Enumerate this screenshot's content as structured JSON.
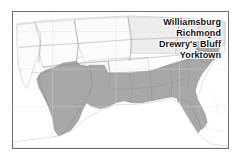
{
  "figure": {
    "name": "united-states-map-confederate-states-virginia-sites",
    "frame_color": "#6e6e6e",
    "background_color": "#ffffff"
  },
  "map": {
    "shaded_region_color": "#a8a8a8",
    "unshaded_region_color": "#fbfbfb",
    "state_border_color": "#8d8d8d",
    "coastline_color": "#9a9a9a",
    "shaded_region_name": "Confederate States",
    "unshaded_region_name": "Union and Western Territories"
  },
  "labels": [
    {
      "id": "williamsburg",
      "text": "Williamsburg",
      "name": "map-label-williamsburg"
    },
    {
      "id": "richmond",
      "text": "Richmond",
      "name": "map-label-richmond"
    },
    {
      "id": "drewrys",
      "text": "Drewry's Bluff",
      "name": "map-label-drewrys-bluff"
    },
    {
      "id": "yorktown",
      "text": "Yorktown",
      "name": "map-label-yorktown"
    }
  ],
  "markers": {
    "color": "#0d0d0d",
    "points": [
      {
        "id": "marker-1",
        "x": 209,
        "y": 36
      },
      {
        "id": "marker-2",
        "x": 215,
        "y": 35
      },
      {
        "id": "marker-3",
        "x": 213,
        "y": 42
      },
      {
        "id": "marker-4",
        "x": 219,
        "y": 40
      },
      {
        "id": "marker-5",
        "x": 218,
        "y": 46
      }
    ]
  }
}
